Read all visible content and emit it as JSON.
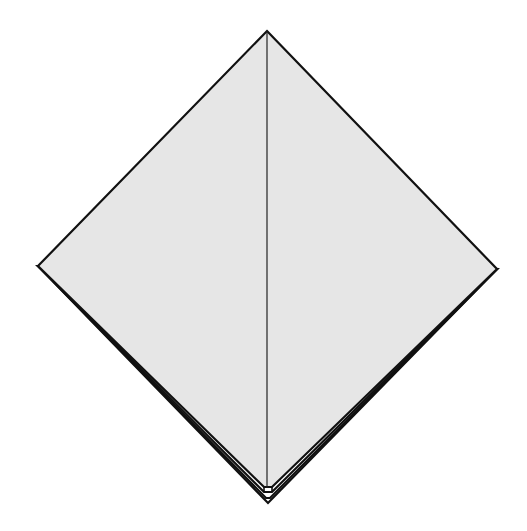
{
  "diagram": {
    "type": "origami-fold-step",
    "colors": {
      "background": "#ffffff",
      "paper": "#e6e6e6",
      "stroke": "#111111"
    },
    "shape": {
      "top": [
        267,
        31
      ],
      "left": [
        38,
        266
      ],
      "right": [
        497,
        269
      ],
      "bottom": [
        268,
        503
      ]
    },
    "center_crease": {
      "from": [
        267,
        31
      ],
      "to": [
        267,
        488
      ]
    },
    "layers": 3
  }
}
